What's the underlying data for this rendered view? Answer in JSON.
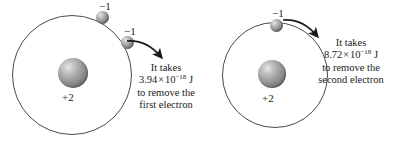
{
  "figure": {
    "background_color": "#ffffff",
    "line_color": "#4a4a4a",
    "text_color": "#1a1a1a"
  },
  "atoms": [
    {
      "id": "left",
      "nucleus_charge": "+2",
      "electrons": [
        {
          "id": "l1",
          "charge": "−1"
        },
        {
          "id": "l2",
          "charge": "−1"
        }
      ],
      "caption": {
        "line1": "It takes",
        "value": "3.94",
        "times": "×",
        "base": "10",
        "exponent": "−18",
        "unit": "J",
        "line3": "to remove the",
        "line4": "first electron"
      }
    },
    {
      "id": "right",
      "nucleus_charge": "+2",
      "electrons": [
        {
          "id": "r1",
          "charge": "−1"
        }
      ],
      "caption": {
        "line1": "It takes",
        "value": "8.72",
        "times": "×",
        "base": "10",
        "exponent": "−18",
        "unit": "J",
        "line3": "to remove the",
        "line4": "second electron"
      }
    }
  ]
}
